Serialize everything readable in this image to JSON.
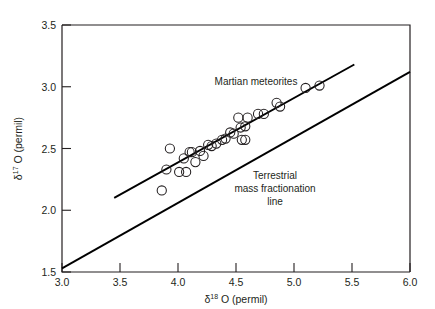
{
  "chart_data": {
    "type": "scatter",
    "title": "",
    "xlabel": "δ¹⁸ O (permil)",
    "ylabel": "δ¹⁷ O (permil)",
    "xlabel_parts": {
      "delta": "δ",
      "sup": "18",
      "rest": " O (permil)"
    },
    "ylabel_parts": {
      "delta": "δ",
      "sup": "17",
      "rest": " O (permil)"
    },
    "xlim": [
      3.0,
      6.0
    ],
    "ylim": [
      1.5,
      3.5
    ],
    "xticks": [
      3.0,
      3.5,
      4.0,
      4.5,
      5.0,
      5.5,
      6.0
    ],
    "yticks": [
      1.5,
      2.0,
      2.5,
      3.0,
      3.5
    ],
    "xtick_labels": [
      "3.0",
      "3.5",
      "4.0",
      "4.5",
      "5.0",
      "5.5",
      "6.0"
    ],
    "ytick_labels": [
      "1.5",
      "2.0",
      "2.5",
      "3.0",
      "3.5"
    ],
    "grid": false,
    "legend": "none",
    "marker": "open-circle",
    "series": [
      {
        "name": "Martian meteorites",
        "marker": "open-circle",
        "points": [
          [
            3.86,
            2.16
          ],
          [
            3.9,
            2.33
          ],
          [
            3.93,
            2.5
          ],
          [
            4.01,
            2.31
          ],
          [
            4.05,
            2.42
          ],
          [
            4.07,
            2.31
          ],
          [
            4.1,
            2.47
          ],
          [
            4.12,
            2.47
          ],
          [
            4.15,
            2.39
          ],
          [
            4.19,
            2.48
          ],
          [
            4.22,
            2.44
          ],
          [
            4.26,
            2.53
          ],
          [
            4.29,
            2.52
          ],
          [
            4.33,
            2.54
          ],
          [
            4.38,
            2.57
          ],
          [
            4.41,
            2.58
          ],
          [
            4.45,
            2.63
          ],
          [
            4.48,
            2.62
          ],
          [
            4.52,
            2.75
          ],
          [
            4.54,
            2.67
          ],
          [
            4.55,
            2.57
          ],
          [
            4.58,
            2.57
          ],
          [
            4.58,
            2.68
          ],
          [
            4.6,
            2.75
          ],
          [
            4.69,
            2.78
          ],
          [
            4.74,
            2.78
          ],
          [
            4.85,
            2.87
          ],
          [
            4.88,
            2.84
          ],
          [
            5.1,
            2.99
          ],
          [
            5.22,
            3.01
          ]
        ]
      }
    ],
    "lines": [
      {
        "name": "martian-fractionation-line",
        "label": "Martian meteorites",
        "x": [
          3.45,
          5.52
        ],
        "y": [
          2.1,
          3.18
        ],
        "slope": 0.522
      },
      {
        "name": "terrestrial-mass-fractionation-line",
        "label": "Terrestrial mass fractionation line",
        "x": [
          3.0,
          6.0
        ],
        "y": [
          1.53,
          3.12
        ],
        "slope": 0.53
      }
    ],
    "annotations": [
      {
        "name": "martian-meteorites-label",
        "text": "Martian meteorites",
        "x": 4.26,
        "y": 3.05,
        "lines": [
          "Martian meteorites"
        ]
      },
      {
        "name": "terrestrial-line-label",
        "text": "Terrestrial mass fractionation line",
        "x": 4.99,
        "y": 2.37,
        "lines": [
          "Terrestrial",
          "mass fractionation",
          "line"
        ]
      }
    ],
    "colors": {
      "axis": "#231f20",
      "line": "#000000",
      "marker_stroke": "#231f20",
      "background": "#ffffff"
    }
  },
  "annotation_labels": {
    "martian_line_1": "Martian meteorites",
    "terrestrial_line_1": "Terrestrial",
    "terrestrial_line_2": "mass fractionation",
    "terrestrial_line_3": "line"
  },
  "axis_titles": {
    "x_delta": "δ",
    "x_sup": "18",
    "x_rest": " O (permil)",
    "y_delta": "δ",
    "y_sup": "17",
    "y_rest": " O (permil)"
  }
}
